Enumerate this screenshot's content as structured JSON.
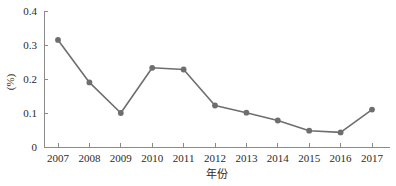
{
  "chart_data": {
    "type": "line",
    "title": "",
    "xlabel": "年份",
    "ylabel": "(%)",
    "categories": [
      "2007",
      "2008",
      "2009",
      "2010",
      "2011",
      "2012",
      "2013",
      "2014",
      "2015",
      "2016",
      "2017"
    ],
    "values": [
      0.315,
      0.19,
      0.1,
      0.233,
      0.228,
      0.122,
      0.101,
      0.078,
      0.048,
      0.043,
      0.11
    ],
    "series": [
      {
        "name": "",
        "values": [
          0.315,
          0.19,
          0.1,
          0.233,
          0.228,
          0.122,
          0.101,
          0.078,
          0.048,
          0.043,
          0.11
        ]
      }
    ],
    "ylim": [
      0,
      0.4
    ],
    "ytick_labels": [
      "0",
      "0.1",
      "0.2",
      "0.3",
      "0.4"
    ],
    "ytick_values": [
      0,
      0.1,
      0.2,
      0.3,
      0.4
    ],
    "xtick_labels": [
      "2007",
      "2008",
      "2009",
      "2010",
      "2011",
      "2012",
      "2013",
      "2014",
      "2015",
      "2016",
      "2017"
    ],
    "grid": false,
    "legend": false,
    "legend_position": "none",
    "line_color": "#6e6e6e",
    "marker_color": "#6e6e6e",
    "axis_color": "#8a8a8a",
    "text_color": "#2b2b2b",
    "background_color": "#ffffff",
    "marker_shape": "circle"
  },
  "axis": {
    "y_title": "(%)",
    "x_title": "年份"
  }
}
